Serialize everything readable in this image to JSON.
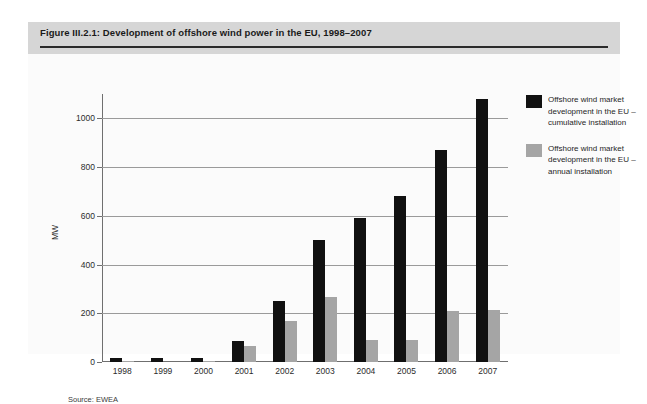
{
  "figure": {
    "title": "Figure III.2.1: Development of offshore wind power in the EU, 1998–2007",
    "source": "Source: EWEA"
  },
  "legend": [
    {
      "label": "Offshore wind market development in the EU – cumulative installation",
      "color": "#111111"
    },
    {
      "label": "Offshore wind market development in the EU – annual installation",
      "color": "#a5a5a5"
    }
  ],
  "chart_data": {
    "type": "bar",
    "title": "Figure III.2.1: Development of offshore wind power in the EU, 1998–2007",
    "xlabel": "",
    "ylabel": "MW",
    "ylim": [
      0,
      1100
    ],
    "yticks": [
      0,
      200,
      400,
      600,
      800,
      1000
    ],
    "grid": true,
    "legend_position": "right",
    "categories": [
      "1998",
      "1999",
      "2000",
      "2001",
      "2002",
      "2003",
      "2004",
      "2005",
      "2006",
      "2007"
    ],
    "series": [
      {
        "name": "Offshore wind market development in the EU – cumulative installation",
        "color": "#111111",
        "values": [
          17,
          17,
          17,
          86,
          250,
          500,
          590,
          680,
          870,
          1080
        ]
      },
      {
        "name": "Offshore wind market development in the EU – annual installation",
        "color": "#a5a5a5",
        "values": [
          5,
          0,
          4,
          64,
          170,
          265,
          90,
          90,
          210,
          215
        ]
      }
    ]
  }
}
